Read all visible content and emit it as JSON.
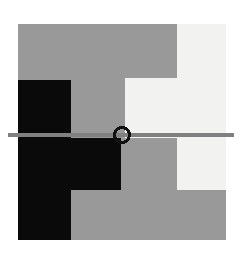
{
  "canvas": {
    "width": 242,
    "height": 255,
    "background_color": "#ffffff",
    "title": "Abstract Geometric Composition"
  },
  "palette": {
    "background": "#ffffff",
    "gray_field": "#999999",
    "off_white": "#f2f2f0",
    "black": "#0a0a0a",
    "line_gray": "#808080",
    "ring_stroke": "#111111"
  },
  "shapes": {
    "gray_square": {
      "name": "gray-square",
      "fill": "#999999",
      "x": 18,
      "y": 24,
      "width": 208,
      "height": 216
    },
    "white_upper_right": {
      "name": "upper-right-white-region",
      "fill": "#f2f2f0",
      "points": "177,24 226,24 226,138 125,138 125,78 177,78",
      "description": "L-shaped light region in upper right with inward notch"
    },
    "white_lower_right": {
      "name": "lower-right-white-block",
      "fill": "#f2f2f0",
      "x": 177,
      "y": 138,
      "width": 49,
      "height": 52
    },
    "black_stair": {
      "name": "black-stair-shape",
      "fill": "#0a0a0a",
      "points": "18,80 71,80 71,138 121,138 121,190 71,190 71,240 18,240",
      "description": "Stepped black figure on the left spanning upper block, wide middle bar, and lower column"
    },
    "horizontal_line": {
      "name": "horizontal-rule",
      "stroke": "#808080",
      "x1": 8,
      "y1": 135,
      "x2": 234,
      "y2": 135,
      "thickness": 4
    },
    "ring": {
      "name": "circle-marker",
      "stroke": "#111111",
      "fill": "none",
      "cx": 122,
      "cy": 135,
      "r": 7.5,
      "stroke_width": 3
    }
  }
}
